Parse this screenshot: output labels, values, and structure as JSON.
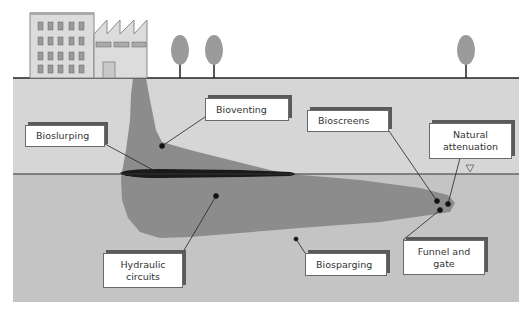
{
  "diagram": {
    "title": "",
    "scene": {
      "surface_objects": [
        "office-building",
        "factory",
        "tree",
        "tree",
        "tree"
      ],
      "layers": [
        "unsaturated zone",
        "water table",
        "saturated zone"
      ],
      "contaminant": "plume with free product layer at water table",
      "water_table_symbol": "▽"
    },
    "labels": {
      "bioslurping": "Bioslurping",
      "bioventing": "Bioventing",
      "bioscreens": "Bioscreens",
      "natural_attenuation": "Natural\nattenuation",
      "hydraulic_circuits": "Hydraulic\ncircuits",
      "biosparging": "Biosparging",
      "funnel_and_gate": "Funnel and\ngate"
    },
    "colors": {
      "sky": "#ffffff",
      "unsaturated_zone": "#d6d6d6",
      "saturated_zone": "#c4c4c4",
      "plume": "#8c8c8c",
      "free_product": "#1a1a1a",
      "building": "#dcdcdc",
      "tree_crown": "#9a9a9a"
    }
  }
}
